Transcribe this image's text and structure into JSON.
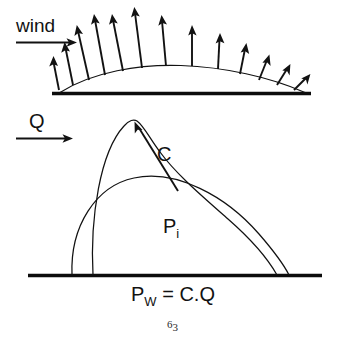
{
  "figure": {
    "title_semantic": "balloon-wind-deformation-diagram",
    "background_color": "#ffffff",
    "ink_color": "#121212",
    "width": 347,
    "height": 346,
    "upper_panel": {
      "name": "wind-pressure-panel",
      "wind_label": "wind",
      "wind_arrow_direction": "right",
      "ground_line": {
        "x1": 52,
        "x2": 311,
        "y": 93
      },
      "dome_apex": {
        "x": 180,
        "y": 66
      },
      "pressure_arrow_count": 13,
      "pressure_arrows": [
        {
          "x": 58,
          "y": 90,
          "len": 31,
          "angle": -8
        },
        {
          "x": 72,
          "y": 84,
          "len": 40,
          "angle": -12
        },
        {
          "x": 88,
          "y": 80,
          "len": 55,
          "angle": -14
        },
        {
          "x": 104,
          "y": 75,
          "len": 68,
          "angle": -12
        },
        {
          "x": 122,
          "y": 72,
          "len": 72,
          "angle": -10
        },
        {
          "x": 142,
          "y": 69,
          "len": 64,
          "angle": -6
        },
        {
          "x": 166,
          "y": 67,
          "len": 48,
          "angle": -2
        },
        {
          "x": 192,
          "y": 67,
          "len": 42,
          "angle": 2
        },
        {
          "x": 218,
          "y": 70,
          "len": 35,
          "angle": 5
        },
        {
          "x": 240,
          "y": 74,
          "len": 29,
          "angle": 10
        },
        {
          "x": 260,
          "y": 79,
          "len": 24,
          "angle": 16
        },
        {
          "x": 278,
          "y": 84,
          "len": 21,
          "angle": 24
        },
        {
          "x": 295,
          "y": 89,
          "len": 18,
          "angle": 34
        }
      ]
    },
    "lower_panel": {
      "name": "balloon-deformation-panel",
      "flow_label": "Q",
      "flow_arrow_direction": "right",
      "ground_line": {
        "x1": 28,
        "x2": 322,
        "y": 275
      },
      "labels": {
        "displacement": "C",
        "internal_pressure_base": "P",
        "internal_pressure_sub": "i",
        "equation_base": "P",
        "equation_sub": "W",
        "equation_rest": " = C.Q"
      },
      "displacement_arrow": {
        "from": {
          "x": 177,
          "y": 190
        },
        "to": {
          "x": 134,
          "y": 122
        }
      },
      "undeformed_dome": {
        "left_x": 72,
        "right_x": 289,
        "apex": {
          "x": 176,
          "y": 176
        }
      },
      "deformed_shape": {
        "left_x": 93,
        "right_x": 277,
        "apex": {
          "x": 136,
          "y": 121
        }
      }
    },
    "page_number": {
      "base": "6",
      "sub": "3"
    }
  }
}
